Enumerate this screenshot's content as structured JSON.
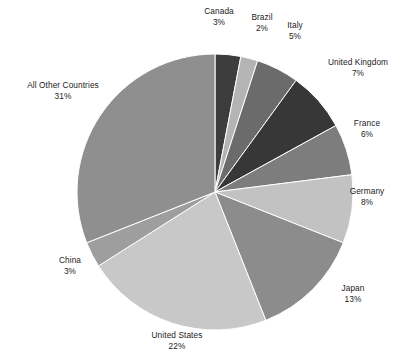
{
  "chart_data": {
    "type": "pie",
    "title": "",
    "subtitle": "",
    "xlabel": "",
    "ylabel": "",
    "legend_position": "none",
    "grid": false,
    "value_unit": "percent",
    "start_angle_deg": 0,
    "direction": "clockwise",
    "categories": [
      "Canada",
      "Brazil",
      "Italy",
      "United Kingdom",
      "France",
      "Germany",
      "Japan",
      "United States",
      "China",
      "All Other Countries"
    ],
    "values": [
      3,
      2,
      5,
      7,
      6,
      8,
      13,
      22,
      3,
      31
    ],
    "labels": [
      "Canada 3%",
      "Brazil 2%",
      "Italy 5%",
      "United Kingdom 7%",
      "France 6%",
      "Germany 8%",
      "Japan 13%",
      "United States 22%",
      "China 3%",
      "All Other Countries 31%"
    ],
    "colors": [
      "#3d3d3d",
      "#b4b4b4",
      "#6b6b6b",
      "#373737",
      "#7d7d7d",
      "#c2c2c2",
      "#8c8c8c",
      "#c8c8c8",
      "#9e9e9e",
      "#8f8f8f"
    ],
    "slices": [
      {
        "name": "Canada",
        "value": 3,
        "percent_label": "3%",
        "color": "#3d3d3d"
      },
      {
        "name": "Brazil",
        "value": 2,
        "percent_label": "2%",
        "color": "#b4b4b4"
      },
      {
        "name": "Italy",
        "value": 5,
        "percent_label": "5%",
        "color": "#6b6b6b"
      },
      {
        "name": "United Kingdom",
        "value": 7,
        "percent_label": "7%",
        "color": "#373737"
      },
      {
        "name": "France",
        "value": 6,
        "percent_label": "6%",
        "color": "#7d7d7d"
      },
      {
        "name": "Germany",
        "value": 8,
        "percent_label": "8%",
        "color": "#c2c2c2"
      },
      {
        "name": "Japan",
        "value": 13,
        "percent_label": "13%",
        "color": "#8c8c8c"
      },
      {
        "name": "United States",
        "value": 22,
        "percent_label": "22%",
        "color": "#c8c8c8"
      },
      {
        "name": "China",
        "value": 3,
        "percent_label": "3%",
        "color": "#9e9e9e"
      },
      {
        "name": "All Other Countries",
        "value": 31,
        "percent_label": "31%",
        "color": "#8f8f8f"
      }
    ]
  },
  "figure": {
    "background": "#ffffff",
    "label_color": "#1c1c1c",
    "center_x": 215,
    "center_y": 192,
    "radius": 138
  },
  "labels": {
    "canada": {
      "name": "Canada",
      "value": "3%"
    },
    "brazil": {
      "name": "Brazil",
      "value": "2%"
    },
    "italy": {
      "name": "Italy",
      "value": "5%"
    },
    "united_kingdom": {
      "name": "United Kingdom",
      "value": "7%"
    },
    "france": {
      "name": "France",
      "value": "6%"
    },
    "germany": {
      "name": "Germany",
      "value": "8%"
    },
    "japan": {
      "name": "Japan",
      "value": "13%"
    },
    "united_states": {
      "name": "United States",
      "value": "22%"
    },
    "china": {
      "name": "China",
      "value": "3%"
    },
    "all_other": {
      "name": "All Other Countries",
      "value": "31%"
    }
  }
}
